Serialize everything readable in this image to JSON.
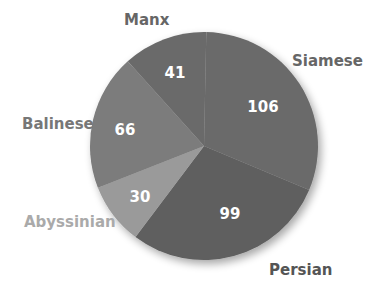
{
  "chart_data": {
    "type": "pie",
    "title": "",
    "categories": [
      "Manx",
      "Siamese",
      "Persian",
      "Abyssinian",
      "Balinese"
    ],
    "values": [
      41,
      106,
      99,
      30,
      66
    ],
    "colors": [
      "#6b6b6b",
      "#6b6b6b",
      "#5f5f5f",
      "#9a9a9a",
      "#7b7b7b"
    ],
    "label_colors": [
      "#666666",
      "#666666",
      "#555555",
      "#aaaaaa",
      "#777777"
    ],
    "start_angle_deg": -42,
    "center": [
      204,
      146
    ],
    "radius": 114,
    "legend": "none (labels placed beside slices)"
  },
  "labels": {
    "manx": "Manx",
    "siamese": "Siamese",
    "persian": "Persian",
    "abyssinian": "Abyssinian",
    "balinese": "Balinese"
  },
  "values": {
    "manx": "41",
    "siamese": "106",
    "persian": "99",
    "abyssinian": "30",
    "balinese": "66"
  }
}
